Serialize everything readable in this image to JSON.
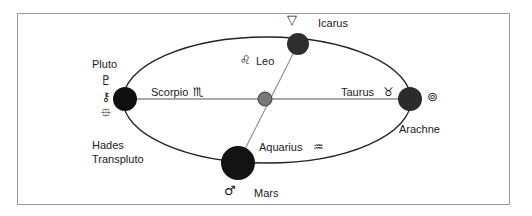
{
  "figure": {
    "border_color": "#9a9a9a",
    "background": "#ffffff",
    "ellipse_color": "#222222",
    "axis_color": "#8c8c8c"
  },
  "ellipse": {
    "cx": 267,
    "cy": 100,
    "rx": 144,
    "ry": 63
  },
  "nodes": [
    {
      "id": "pluto",
      "label": "Pluto",
      "secondary_labels": [
        "Hades",
        "Transpluto"
      ],
      "glyphs": [
        "♇",
        "⚷",
        "⯐"
      ],
      "glyph_names": [
        "pluto-glyph",
        "hades-glyph",
        "transpluto-glyph"
      ],
      "cx": 125,
      "cy": 99,
      "r": 12,
      "color": "#101010"
    },
    {
      "id": "icarus",
      "label": "Icarus",
      "glyphs": [
        "▽"
      ],
      "glyph_names": [
        "icarus-glyph"
      ],
      "cx": 298,
      "cy": 44,
      "r": 11,
      "color": "#2e2e2e"
    },
    {
      "id": "arachne",
      "label": "Arachne",
      "glyphs": [
        "⊚"
      ],
      "glyph_names": [
        "arachne-glyph"
      ],
      "cx": 410,
      "cy": 99,
      "r": 12,
      "color": "#2b2b2b"
    },
    {
      "id": "mars",
      "label": "Mars",
      "glyphs": [
        "♂"
      ],
      "glyph_names": [
        "mars-glyph"
      ],
      "cx": 238,
      "cy": 163,
      "r": 17,
      "color": "#131313"
    },
    {
      "id": "center",
      "label": "",
      "glyphs": [],
      "glyph_names": [],
      "cx": 265,
      "cy": 99,
      "r": 7,
      "color": "#787878"
    }
  ],
  "signs": [
    {
      "id": "scorpio",
      "name": "Scorpio",
      "glyph": "♏",
      "x": 151,
      "y": 90
    },
    {
      "id": "leo",
      "name": "Leo",
      "glyph": "♌",
      "x": 233,
      "y": 54,
      "glyph_first": true
    },
    {
      "id": "taurus",
      "name": "Taurus",
      "glyph": "♉",
      "x": 337,
      "y": 89
    },
    {
      "id": "aquarius",
      "name": "Aquarius",
      "glyph": "♒",
      "x": 259,
      "y": 143
    }
  ],
  "labels": {
    "pluto": "Pluto",
    "hades": "Hades",
    "transpluto": "Transpluto",
    "icarus": "Icarus",
    "arachne": "Arachne",
    "mars": "Mars",
    "scorpio": "Scorpio",
    "leo": "Leo",
    "taurus": "Taurus",
    "aquarius": "Aquarius"
  },
  "glyphs": {
    "pluto": "♇",
    "hades": "⚷",
    "transpluto": "⯐",
    "icarus": "▽",
    "arachne": "⊚",
    "mars": "♂",
    "scorpio": "♏",
    "leo": "♌",
    "taurus": "♉",
    "aquarius": "♒"
  }
}
